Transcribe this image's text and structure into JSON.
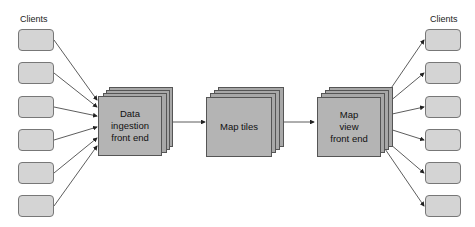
{
  "diagram": {
    "left_group_label": "Clients",
    "right_group_label": "Clients",
    "left_clients_count": 6,
    "right_clients_count": 6,
    "nodes": [
      {
        "id": "ingest",
        "label": "Data\ningestion\nfront end"
      },
      {
        "id": "tiles",
        "label": "Map tiles"
      },
      {
        "id": "view",
        "label": "Map\nview\nfront end"
      }
    ],
    "edges": [
      {
        "from": "left_clients",
        "to": "ingest"
      },
      {
        "from": "ingest",
        "to": "tiles"
      },
      {
        "from": "tiles",
        "to": "view"
      },
      {
        "from": "view",
        "to": "right_clients"
      }
    ],
    "colors": {
      "client_fill": "#d4d4d4",
      "node_fill": "#b4b4b4",
      "stroke": "#555555"
    }
  }
}
